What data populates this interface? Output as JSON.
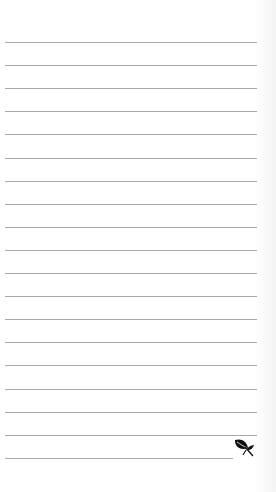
{
  "paper": {
    "type": "lined-notepaper",
    "line_count": 19,
    "first_line_y": 42,
    "line_spacing": 23.1,
    "line_color": "#a8a8a8",
    "background": "#ffffff"
  },
  "decoration": {
    "icon": "leaf-icon",
    "color": "#111111"
  }
}
